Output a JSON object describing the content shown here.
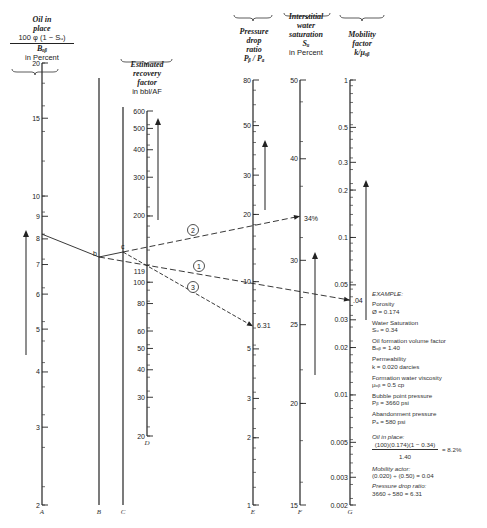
{
  "headers": {
    "A": {
      "line1": "Oil in",
      "line2": "place",
      "formula_num": "100 φ (1 − Sᵤ)",
      "formula_den": "Bₒᵦ",
      "unit": "in Percent"
    },
    "D": {
      "line1": "Estimated",
      "line2": "recovery",
      "line3": "factor",
      "unit": "in bbl/AF"
    },
    "E": {
      "line1": "Pressure",
      "line2": "drop",
      "line3": "ratio",
      "formula": "Pᵦ / Pₐ"
    },
    "F": {
      "line1": "Interstitial",
      "line2": "water",
      "line3": "saturation",
      "formula": "Sᵤ",
      "unit": "in Percent"
    },
    "G": {
      "line1": "Mobility",
      "line2": "factor",
      "formula": "k/μₒᵦ"
    }
  },
  "example": {
    "title": "EXAMPLE:",
    "items": [
      {
        "label": "Porosity",
        "value": "Ø = 0.174"
      },
      {
        "label": "Water Saturation",
        "value": "Sᵤ = 0.34"
      },
      {
        "label": "Oil formation volume factor",
        "value": "Bₒᵦ = 1.40"
      },
      {
        "label": "Permeability",
        "value": "k = 0.020 darcies"
      },
      {
        "label": "Formation water viscosity",
        "value": "μₒᵦ = 0.5 cp"
      },
      {
        "label": "Bubble point pressure",
        "value": "Pᵦ = 3660 psi"
      },
      {
        "label": "Abandonment pressure",
        "value": "Pₐ = 580 psi"
      }
    ],
    "calc_oil_label": "Oil in place:",
    "calc_oil_num": "(100)(0.174)(1 − 0.34)",
    "calc_oil_den": "1.40",
    "calc_oil_result": "= 8.2%",
    "calc_mob_label": "Mobility actor:",
    "calc_mob": "(0.020) ÷ (0.50) = 0.04",
    "calc_pdr_label": "Pressure drop ratio:",
    "calc_pdr": "3660 ÷ 580 = 6.31"
  },
  "chart_data": {
    "type": "nomograph",
    "axes": [
      {
        "id": "A",
        "label": "Oil in place 100φ(1−Sw)/Bob in Percent",
        "scale": "log",
        "min": 2,
        "max": 20,
        "ticks": [
          2,
          3,
          4,
          5,
          6,
          7,
          8,
          9,
          10,
          15,
          20
        ]
      },
      {
        "id": "B",
        "label": "B",
        "scale": "pivot"
      },
      {
        "id": "C",
        "label": "C",
        "scale": "pivot"
      },
      {
        "id": "D",
        "label": "Estimated recovery factor in bbl/AF",
        "scale": "log",
        "min": 20,
        "max": 600,
        "ticks": [
          20,
          30,
          40,
          50,
          60,
          80,
          100,
          200,
          300,
          400,
          500,
          600
        ]
      },
      {
        "id": "E",
        "label": "Pressure drop ratio Pb/Pa",
        "scale": "log",
        "min": 1,
        "max": 80,
        "ticks": [
          1,
          2,
          3,
          5,
          10,
          20,
          30,
          50,
          80
        ]
      },
      {
        "id": "F",
        "label": "Interstitial water saturation Sw in Percent",
        "scale": "log",
        "min": 15,
        "max": 50,
        "ticks": [
          15,
          20,
          25,
          30,
          40,
          50
        ]
      },
      {
        "id": "G",
        "label": "Mobility factor k/μob",
        "scale": "log",
        "min": 0.002,
        "max": 1,
        "ticks": [
          0.002,
          0.003,
          0.005,
          0.01,
          0.02,
          0.03,
          0.05,
          0.1,
          0.2,
          0.3,
          0.5,
          1
        ]
      }
    ],
    "annotations": [
      {
        "axis": "A",
        "value": 8.2
      },
      {
        "point": "b"
      },
      {
        "point": "c"
      },
      {
        "axis": "D",
        "value": 119,
        "label": "119"
      },
      {
        "axis": "E",
        "value": 6.31,
        "label": "6.31"
      },
      {
        "axis": "F",
        "value": 34,
        "label": "34%"
      },
      {
        "axis": "G",
        "value": 0.04,
        "label": ".04"
      }
    ],
    "lines": [
      {
        "id": "1",
        "from": "b",
        "to": "G=0.04",
        "style": "dashed"
      },
      {
        "id": "2",
        "from": "c",
        "to": "F=34%",
        "style": "dashed"
      },
      {
        "id": "3",
        "from": "c",
        "to": "E=6.31",
        "style": "dashed",
        "through": "D=119"
      }
    ]
  }
}
